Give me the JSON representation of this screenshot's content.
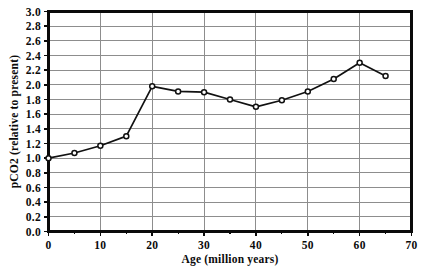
{
  "chart_data": {
    "type": "line",
    "title": "",
    "xlabel": "Age (million years)",
    "ylabel": "pCO2 (relative to present)",
    "xlim": [
      0,
      70
    ],
    "ylim": [
      0.0,
      3.0
    ],
    "xticks": [
      0,
      10,
      20,
      30,
      40,
      50,
      60,
      70
    ],
    "xtick_labels": [
      "0",
      "10",
      "20",
      "30",
      "40",
      "50",
      "60",
      "70"
    ],
    "xtick_minor_step": 5,
    "yticks": [
      0.0,
      0.2,
      0.4,
      0.6,
      0.8,
      1.0,
      1.2,
      1.4,
      1.6,
      1.8,
      2.0,
      2.2,
      2.4,
      2.6,
      2.8,
      3.0
    ],
    "ytick_labels": [
      "0.0",
      "0.2",
      "0.4",
      "0.6",
      "0.8",
      "1.0",
      "1.2",
      "1.4",
      "1.6",
      "1.8",
      "2.0",
      "2.2",
      "2.4",
      "2.6",
      "2.8",
      "3.0"
    ],
    "grid": {
      "horizontal": true,
      "vertical": true,
      "color": "#8d8d8d"
    },
    "legend": null,
    "series": [
      {
        "name": "pCO2",
        "marker": "open-circle",
        "line_color": "#111111",
        "x": [
          0,
          5,
          10,
          15,
          20,
          25,
          30,
          35,
          40,
          45,
          50,
          55,
          60,
          65
        ],
        "values": [
          1.0,
          1.07,
          1.17,
          1.3,
          1.98,
          1.91,
          1.9,
          1.8,
          1.7,
          1.79,
          1.91,
          2.08,
          2.3,
          2.12
        ]
      }
    ]
  }
}
